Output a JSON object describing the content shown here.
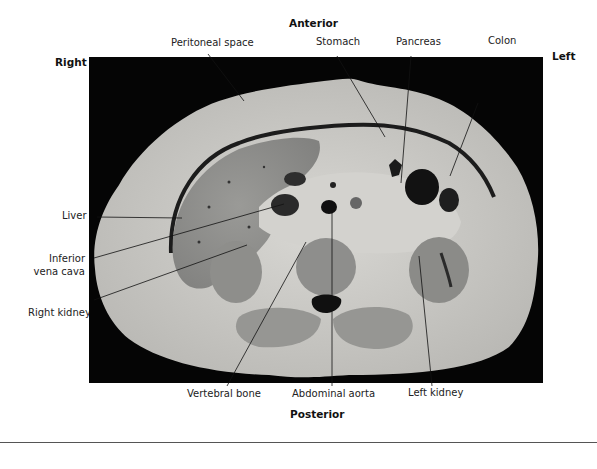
{
  "figure": {
    "orientation": {
      "anterior": "Anterior",
      "posterior": "Posterior",
      "right": "Right",
      "left": "Left"
    },
    "labels": {
      "peritoneal_space": "Peritoneal space",
      "stomach": "Stomach",
      "pancreas": "Pancreas",
      "colon": "Colon",
      "liver": "Liver",
      "inferior_vena_cava_line1": "Inferior",
      "inferior_vena_cava_line2": "vena cava",
      "right_kidney": "Right kidney",
      "vertebral_bone": "Vertebral bone",
      "abdominal_aorta": "Abdominal aorta",
      "left_kidney": "Left kidney"
    },
    "colors": {
      "background": "#ffffff",
      "panel": "#050505",
      "body_wall": "#c9c9c6",
      "organ": "#8d8d8b",
      "fat": "#d6d5d1",
      "vessel": "#1a1a1a",
      "leader_line": "#111111",
      "divider": "#555555"
    }
  }
}
